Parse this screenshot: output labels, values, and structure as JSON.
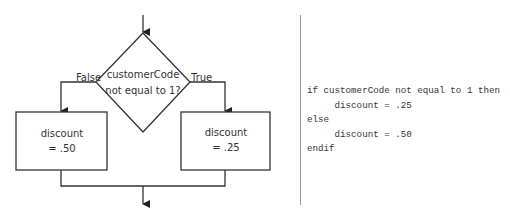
{
  "flowchart": {
    "decision": {
      "line1": "customerCode",
      "line2": "not equal to 1?"
    },
    "false_label": "False",
    "true_label": "True",
    "left_box": {
      "line1": "discount",
      "line2": "= .50"
    },
    "right_box": {
      "line1": "discount",
      "line2": "= .25"
    }
  },
  "pseudocode": {
    "lines": [
      "if customerCode not equal to 1 then",
      "     discount = .25",
      "else",
      "     discount = .50",
      "endif"
    ]
  }
}
